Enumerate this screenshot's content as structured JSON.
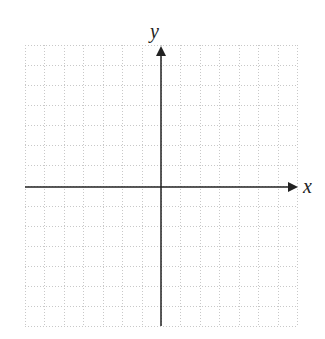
{
  "diagram": {
    "type": "coordinate-plane",
    "x_axis_label": "x",
    "y_axis_label": "y",
    "grid": {
      "columns": 14,
      "rows": 14,
      "style": "dotted",
      "color": "#c8c8c8"
    },
    "axis_color": "#222222"
  }
}
